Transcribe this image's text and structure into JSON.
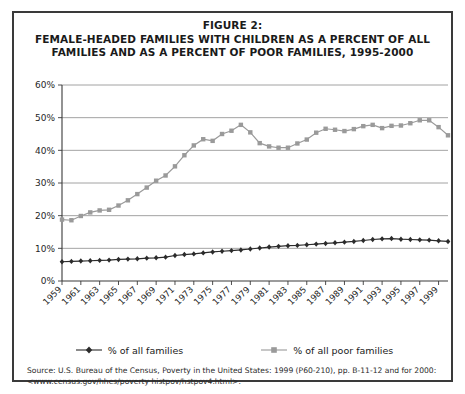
{
  "figure": {
    "title_line1": "FIGURE 2:",
    "title_line2": "FEMALE-HEADED FAMILIES WITH CHILDREN AS A PERCENT OF ALL",
    "title_line3": "FAMILIES AND AS A PERCENT OF POOR FAMILIES, 1995-2000",
    "source_note": "Source: U.S. Bureau of the Census, Poverty in the United States: 1999 (P60-210), pp. B-11-12 and for 2000: <www.census.gov/hhes/poverty histpov/hstpov4.html>."
  },
  "legend": {
    "position": "bottom",
    "entries": [
      {
        "label": "% of all families",
        "color": "#2b2b2b",
        "marker": "diamond"
      },
      {
        "label": "% of all poor families",
        "color": "#9a9a9a",
        "marker": "square"
      }
    ]
  },
  "chart_data": {
    "type": "line",
    "title": "FEMALE-HEADED FAMILIES WITH CHILDREN AS A PERCENT OF ALL FAMILIES AND AS A PERCENT OF POOR FAMILIES, 1995-2000",
    "xlabel": "",
    "ylabel": "",
    "grid": true,
    "ylim": [
      0,
      60
    ],
    "ytick_labels": [
      "0%",
      "10%",
      "20%",
      "30%",
      "40%",
      "50%",
      "60%"
    ],
    "ytick_values": [
      0,
      10,
      20,
      30,
      40,
      50,
      60
    ],
    "x": [
      1959,
      1960,
      1961,
      1962,
      1963,
      1964,
      1965,
      1966,
      1967,
      1968,
      1969,
      1970,
      1971,
      1972,
      1973,
      1974,
      1975,
      1976,
      1977,
      1978,
      1979,
      1980,
      1981,
      1982,
      1983,
      1984,
      1985,
      1986,
      1987,
      1988,
      1989,
      1990,
      1991,
      1992,
      1993,
      1994,
      1995,
      1996,
      1997,
      1998,
      1999,
      2000
    ],
    "xtick_labels": [
      "1959",
      "1961",
      "1963",
      "1965",
      "1967",
      "1969",
      "1971",
      "1973",
      "1975",
      "1977",
      "1979",
      "1981",
      "1983",
      "1985",
      "1987",
      "1989",
      "1991",
      "1993",
      "1995",
      "1997",
      "1999"
    ],
    "series": [
      {
        "name": "% of all families",
        "color": "#2b2b2b",
        "marker": "diamond",
        "values": [
          5.9,
          6.0,
          6.1,
          6.2,
          6.3,
          6.4,
          6.6,
          6.7,
          6.8,
          7.0,
          7.1,
          7.3,
          7.8,
          8.1,
          8.3,
          8.6,
          8.9,
          9.1,
          9.3,
          9.5,
          9.8,
          10.1,
          10.4,
          10.6,
          10.8,
          10.9,
          11.1,
          11.3,
          11.5,
          11.7,
          11.9,
          12.1,
          12.4,
          12.7,
          12.9,
          13.0,
          12.8,
          12.7,
          12.6,
          12.5,
          12.3,
          12.1
        ]
      },
      {
        "name": "% of all poor families",
        "color": "#9a9a9a",
        "marker": "square",
        "values": [
          18.8,
          18.6,
          19.9,
          21.0,
          21.6,
          21.8,
          23.1,
          24.7,
          26.6,
          28.6,
          30.7,
          32.3,
          35.1,
          38.5,
          41.5,
          43.4,
          42.9,
          45.0,
          46.0,
          47.8,
          45.5,
          42.2,
          41.2,
          40.8,
          40.8,
          42.1,
          43.3,
          45.4,
          46.6,
          46.3,
          45.9,
          46.5,
          47.4,
          47.8,
          46.8,
          47.5,
          47.6,
          48.3,
          49.2,
          49.2,
          47.1,
          44.6
        ]
      }
    ]
  }
}
